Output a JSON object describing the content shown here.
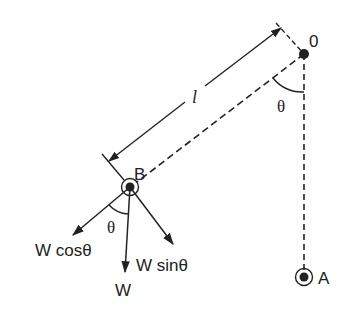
{
  "diagram": {
    "colors": {
      "ink": "#222222",
      "background": "#ffffff"
    },
    "points": {
      "pivot": {
        "label": "0",
        "x": 304,
        "y": 54
      },
      "bob": {
        "label": "B",
        "x": 130,
        "y": 187
      },
      "rest": {
        "label": "A",
        "x": 304,
        "y": 277
      }
    },
    "length_label": "l",
    "angle_label_pivot": "θ",
    "angle_label_bob": "θ",
    "forces": {
      "weight": "W",
      "radial": "W cosθ",
      "tangential": "W sinθ"
    }
  }
}
